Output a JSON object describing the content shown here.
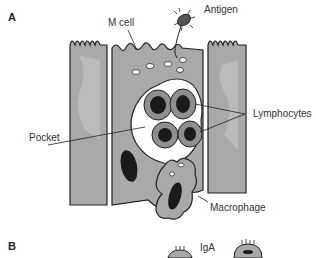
{
  "panels": {
    "a": {
      "label": "A"
    },
    "b": {
      "label": "B"
    }
  },
  "labels": {
    "m_cell": "M cell",
    "antigen": "Antigen",
    "lymphocytes": "Lymphocytes",
    "pocket": "Pocket",
    "macrophage": "Macrophage",
    "iga": "IgA"
  },
  "colors": {
    "tissue": "#a9a9a9",
    "tissue_light": "#c8c8c8",
    "outline": "#222222",
    "nucleus": "#1a1a1a",
    "cell_fill": "#8f8f8f",
    "pocket_fill": "#ffffff"
  }
}
